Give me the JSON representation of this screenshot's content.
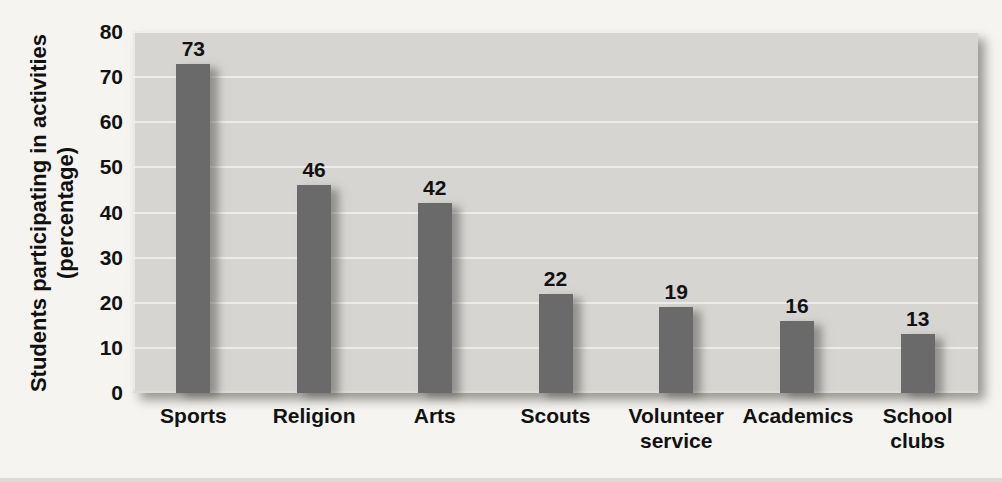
{
  "chart_data": {
    "type": "bar",
    "title": "",
    "categories": [
      "Sports",
      "Religion",
      "Arts",
      "Scouts",
      "Volunteer service",
      "Academics",
      "School clubs"
    ],
    "values": [
      73,
      46,
      42,
      22,
      19,
      16,
      13
    ],
    "ylabel": "Students participating in activities (percentage)",
    "ylabel_lines": [
      "Students participating in activities",
      "(percentage)"
    ],
    "xlabel": "",
    "ylim": [
      0,
      80
    ],
    "yticks": [
      0,
      10,
      20,
      30,
      40,
      50,
      60,
      70,
      80
    ],
    "grid": true,
    "legend_position": "none",
    "bar_color": "#6b6a6a",
    "plot_background": "#d6d5d2",
    "gridline_color": "#eeede9",
    "page_background": "#f5f4f1",
    "text_color": "#121212"
  }
}
